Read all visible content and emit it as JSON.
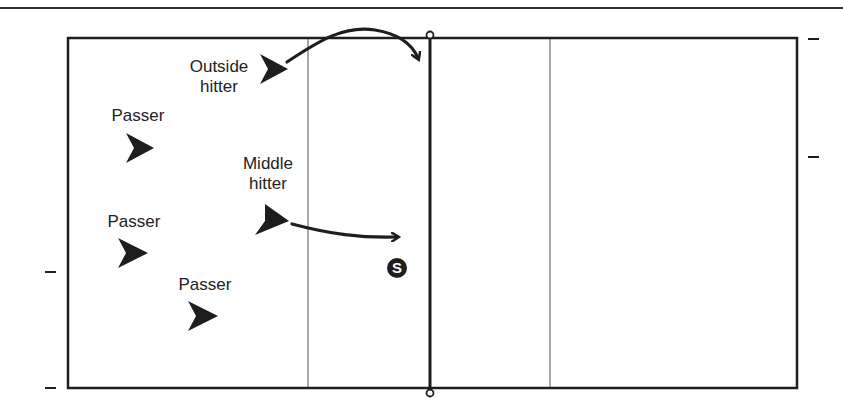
{
  "diagram": {
    "type": "volleyball-court-rotation",
    "colors": {
      "ink": "#1e1e1e",
      "thin_line": "#555555",
      "background": "#ffffff"
    },
    "players": [
      {
        "id": "outside-hitter",
        "label_line1": "Outside",
        "label_line2": "hitter"
      },
      {
        "id": "passer-1",
        "label_line1": "Passer"
      },
      {
        "id": "middle-hitter",
        "label_line1": "Middle",
        "label_line2": "hitter"
      },
      {
        "id": "passer-2",
        "label_line1": "Passer"
      },
      {
        "id": "passer-3",
        "label_line1": "Passer"
      }
    ],
    "setter": {
      "symbol": "S"
    }
  }
}
